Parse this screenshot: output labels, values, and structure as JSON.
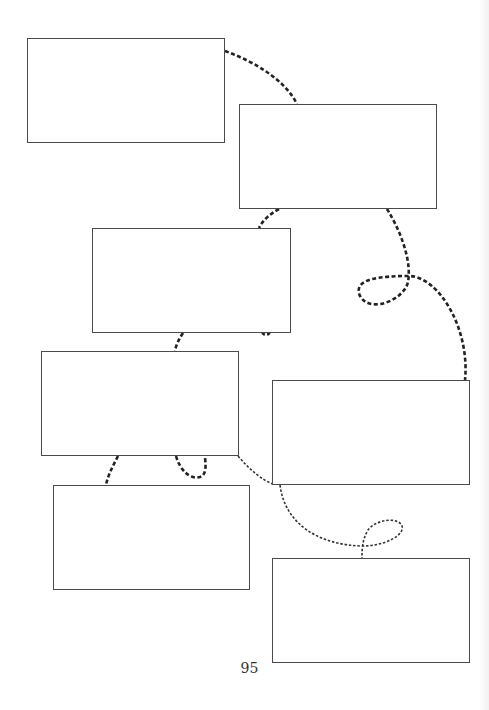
{
  "page": {
    "page_number": "95",
    "line_color": "#222222",
    "box_border_color": "#4a4a4a"
  },
  "boxes": [
    {
      "id": "box-1",
      "x": 27,
      "y": 38,
      "w": 198,
      "h": 105,
      "text": ""
    },
    {
      "id": "box-2",
      "x": 239,
      "y": 104,
      "w": 198,
      "h": 105,
      "text": ""
    },
    {
      "id": "box-3",
      "x": 92,
      "y": 228,
      "w": 199,
      "h": 105,
      "text": ""
    },
    {
      "id": "box-4",
      "x": 41,
      "y": 351,
      "w": 198,
      "h": 105,
      "text": ""
    },
    {
      "id": "box-5",
      "x": 272,
      "y": 380,
      "w": 198,
      "h": 105,
      "text": ""
    },
    {
      "id": "box-6",
      "x": 53,
      "y": 485,
      "w": 197,
      "h": 105,
      "text": ""
    },
    {
      "id": "box-7",
      "x": 272,
      "y": 558,
      "w": 198,
      "h": 105,
      "text": ""
    }
  ]
}
